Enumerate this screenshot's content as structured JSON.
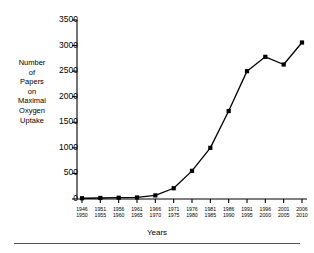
{
  "chart_data": {
    "type": "line",
    "title": "",
    "xlabel": "Years",
    "ylabel": "Number of Papers on Maximal Oxygen Uptake",
    "ylabel_lines": [
      "Number",
      "of",
      "Papers",
      "on",
      "Maximal",
      "Oxygen",
      "Uptake"
    ],
    "categories": [
      "1946–1950",
      "1951–1955",
      "1956–1960",
      "1961–1965",
      "1966–1970",
      "1971–1975",
      "1976–1980",
      "1981–1985",
      "1986–1990",
      "1991–1995",
      "1996–2000",
      "2001–2005",
      "2006–2010"
    ],
    "category_start_labels": [
      "1946",
      "1951",
      "1956",
      "1961",
      "1966",
      "1971",
      "1976",
      "1981",
      "1986",
      "1991",
      "1996",
      "2001",
      "2006"
    ],
    "category_end_labels": [
      "1950",
      "1955",
      "1960",
      "1965",
      "1970",
      "1975",
      "1980",
      "1985",
      "1990",
      "1995",
      "2000",
      "2005",
      "2010"
    ],
    "values": [
      15,
      20,
      25,
      30,
      70,
      210,
      550,
      1000,
      1720,
      2500,
      2780,
      2630,
      3060
    ],
    "ylim": [
      0,
      3500
    ],
    "yticks": [
      0,
      500,
      1000,
      1500,
      2000,
      2500,
      3000,
      3500
    ],
    "ytick_labels": [
      "0",
      "500",
      "1000",
      "1500",
      "2000",
      "2500",
      "3000",
      "3500"
    ],
    "grid": false,
    "legend": null,
    "marker": "filled-square",
    "line_color": "#000000",
    "marker_color": "#000000"
  }
}
